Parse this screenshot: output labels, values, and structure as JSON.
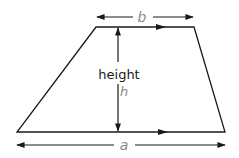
{
  "diagram": {
    "type": "trapezium",
    "labels": {
      "top_side": "b",
      "bottom_side": "a",
      "height_word": "height",
      "height_symbol": "h"
    },
    "colors": {
      "outline": "#1a1a1a",
      "label_gray": "#8a8a8a",
      "text_dark": "#1a1a1a",
      "background": "#ffffff"
    }
  }
}
